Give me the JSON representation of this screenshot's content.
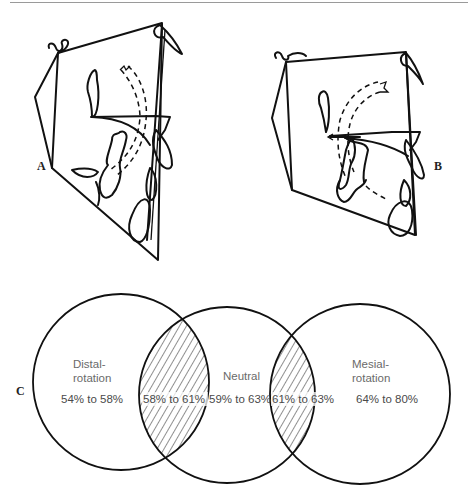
{
  "figure": {
    "panels": [
      {
        "letter": "A",
        "description": "cephalometric tracing with dashed arc showing distal rotation"
      },
      {
        "letter": "B",
        "description": "cephalometric tracing with dashed arc showing mesial rotation"
      },
      {
        "letter": "C",
        "description": "Venn diagram of rotation ranges"
      }
    ]
  },
  "venn": {
    "letter": "C",
    "circles": [
      {
        "label_line1": "Distal-",
        "label_line2": "rotation",
        "range": "54% to 58%"
      },
      {
        "label_line1": "Neutral",
        "label_line2": "",
        "range": "59% to 63%"
      },
      {
        "label_line1": "Mesial-",
        "label_line2": "rotation",
        "range": "64% to 80%"
      }
    ],
    "overlaps": [
      {
        "between": "Distal-rotation / Neutral",
        "range": "58% to 61%",
        "hatched": true
      },
      {
        "between": "Neutral / Mesial-rotation",
        "range": "61% to 63%",
        "hatched": true
      }
    ]
  },
  "colors": {
    "line": "#111111",
    "label_text": "#6a6a6a",
    "range_text": "#4a4a4a",
    "rule": "#9a9a9a"
  }
}
